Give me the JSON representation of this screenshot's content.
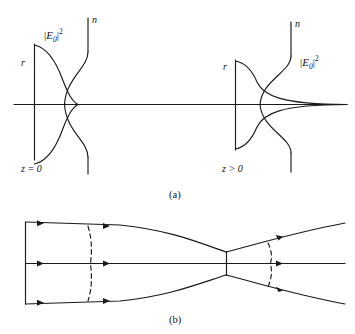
{
  "figure": {
    "panels": [
      {
        "id": "a",
        "caption": "(a)",
        "description": "Transverse intensity profile |E0|^2 and refractive index n profile of a self-focusing beam at the entrance plane and after propagation",
        "groups": [
          {
            "id": "left",
            "position_label": "z = 0",
            "radial_axis_label": "r",
            "index_axis_label": "n",
            "intensity_label": {
              "bar_open": "|",
              "field": "E",
              "subscript": "0",
              "bar_close": "|",
              "exponent": "2"
            }
          },
          {
            "id": "right",
            "position_label": "z > 0",
            "radial_axis_label": "r",
            "index_axis_label": "n",
            "intensity_label": {
              "bar_open": "|",
              "field": "E",
              "subscript": "0",
              "bar_close": "|",
              "exponent": "2"
            }
          }
        ]
      },
      {
        "id": "b",
        "caption": "(b)",
        "description": "Ray diagram of beam self-focusing showing converging rays, curved wavefronts and the focal waist"
      }
    ],
    "stroke_color": "#1a1a1a",
    "background_color": "#ffffff"
  }
}
